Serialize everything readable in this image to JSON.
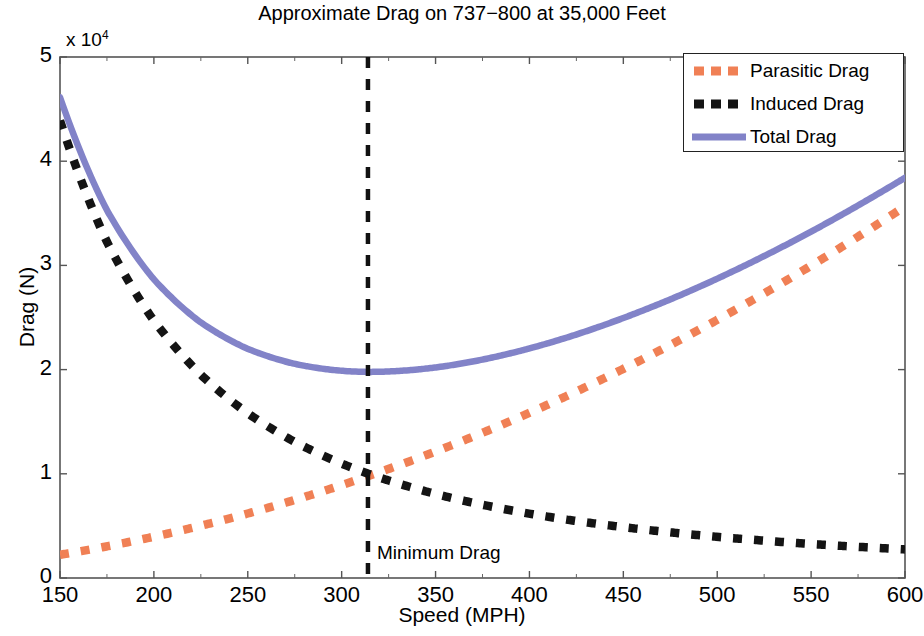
{
  "chart_data": {
    "type": "line",
    "title": "Approximate Drag on 737−800 at 35,000 Feet",
    "xlabel": "Speed (MPH)",
    "ylabel": "Drag (N)",
    "y_multiplier": "x 10",
    "y_multiplier_exp": "4",
    "xlim": [
      150,
      600
    ],
    "ylim": [
      0,
      50000
    ],
    "xticks": [
      150,
      200,
      250,
      300,
      350,
      400,
      450,
      500,
      550,
      600
    ],
    "xtick_labels": [
      "150",
      "200",
      "250",
      "300",
      "350",
      "400",
      "450",
      "500",
      "550",
      "600"
    ],
    "yticks": [
      0,
      10000,
      20000,
      30000,
      40000,
      50000
    ],
    "ytick_labels": [
      "0",
      "1",
      "2",
      "3",
      "4",
      "5"
    ],
    "grid": false,
    "legend_position": "top-right",
    "legend": [
      "Parasitic Drag",
      "Induced Drag",
      "Total Drag"
    ],
    "annotations": [
      {
        "text": "Minimum Drag",
        "x": 320,
        "y": 3200
      }
    ],
    "vertical_marker": {
      "x": 314,
      "label": "Minimum Drag",
      "color": "#111111",
      "style": "dashed"
    },
    "x": [
      150,
      175,
      200,
      225,
      250,
      275,
      300,
      314,
      325,
      350,
      375,
      400,
      425,
      450,
      475,
      500,
      525,
      550,
      575,
      600
    ],
    "series": [
      {
        "name": "Parasitic Drag",
        "color": "#F08055",
        "style": "dashed",
        "values": [
          2230,
          3035,
          3965,
          5015,
          6190,
          7490,
          8915,
          9770,
          10465,
          12140,
          13935,
          15855,
          17900,
          20070,
          22360,
          24775,
          27315,
          29975,
          32760,
          35670
        ]
      },
      {
        "name": "Induced Drag",
        "color": "#141414",
        "style": "dashed",
        "values": [
          43900,
          32265,
          24695,
          19510,
          15805,
          13060,
          10975,
          10010,
          9355,
          8065,
          7025,
          6175,
          5470,
          4880,
          4380,
          3950,
          3585,
          3265,
          2990,
          2745
        ]
      },
      {
        "name": "Total Drag",
        "color": "#8283C8",
        "style": "solid",
        "values": [
          46130,
          35300,
          28660,
          24525,
          21995,
          20550,
          19890,
          19780,
          19820,
          20205,
          20960,
          22030,
          23370,
          24950,
          26740,
          28725,
          30900,
          33240,
          35750,
          38415
        ]
      }
    ]
  },
  "axes": {
    "title": "Approximate Drag on 737−800 at 35,000 Feet",
    "multiplier_text": "x 10",
    "multiplier_exp": "4",
    "x_label": "Speed (MPH)",
    "y_label": "Drag (N)"
  },
  "legend": {
    "items": [
      {
        "label": "Parasitic Drag",
        "color": "#F08055",
        "style": "dashed"
      },
      {
        "label": "Induced Drag",
        "color": "#141414",
        "style": "dashed"
      },
      {
        "label": "Total Drag",
        "color": "#8283C8",
        "style": "solid"
      }
    ]
  },
  "annotation": {
    "minimum_drag": "Minimum Drag"
  }
}
